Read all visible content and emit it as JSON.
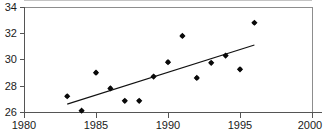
{
  "chart_data": {
    "type": "scatter",
    "title": "",
    "xlabel": "",
    "ylabel": "",
    "xlim": [
      1980,
      2000
    ],
    "ylim": [
      26,
      34
    ],
    "grid": false,
    "legend": null,
    "x_ticks": [
      1980,
      1985,
      1990,
      1995,
      2000
    ],
    "x_tick_labels": [
      "1980",
      "1985",
      "1990",
      "1995",
      "2000"
    ],
    "y_ticks": [
      26,
      28,
      30,
      32,
      34
    ],
    "y_tick_labels": [
      "26",
      "28",
      "30",
      "32",
      "34"
    ],
    "series": [
      {
        "name": "observations",
        "marker": "diamond",
        "x": [
          1983,
          1984,
          1985,
          1986,
          1987,
          1988,
          1989,
          1990,
          1991,
          1992,
          1993,
          1994,
          1995,
          1996
        ],
        "values": [
          27.2,
          26.1,
          29.0,
          27.8,
          26.85,
          26.85,
          28.7,
          29.8,
          31.8,
          28.6,
          29.75,
          30.3,
          29.25,
          32.8
        ]
      },
      {
        "name": "trend-line",
        "marker": "none",
        "x": [
          1983,
          1996
        ],
        "values": [
          26.6,
          31.1
        ]
      }
    ]
  }
}
